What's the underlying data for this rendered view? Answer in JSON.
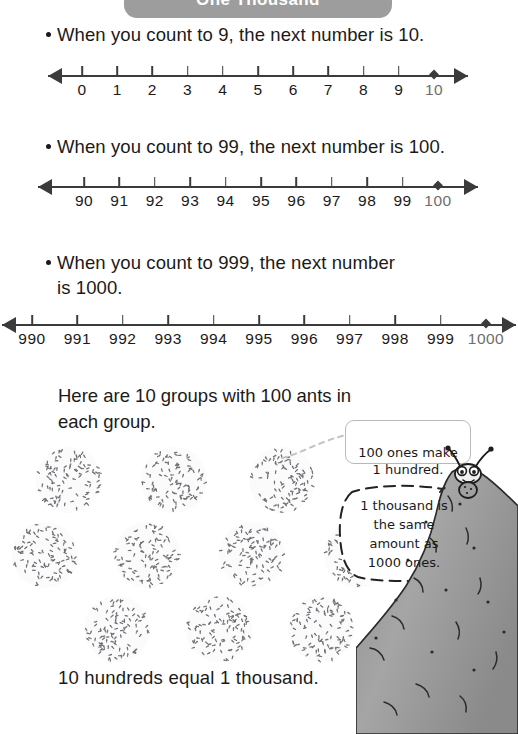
{
  "header": {
    "title": "One Thousand",
    "background_color": "#9d9d9d",
    "text_color": "#ffffff"
  },
  "bullets": [
    {
      "text": "When you count to 9, the next number is 10."
    },
    {
      "text": "When you count to 99, the next number is 100."
    },
    {
      "text": "When you count to 999, the next number\nis 1000."
    }
  ],
  "number_lines": [
    {
      "name": "ones-number-line",
      "labels": [
        "0",
        "1",
        "2",
        "3",
        "4",
        "5",
        "6",
        "7",
        "8",
        "9",
        "10"
      ],
      "marked_value": "10",
      "left_arrow": true,
      "right_arrow": true
    },
    {
      "name": "tens-number-line",
      "labels": [
        "90",
        "91",
        "92",
        "93",
        "94",
        "95",
        "96",
        "97",
        "98",
        "99",
        "100"
      ],
      "marked_value": "100",
      "left_arrow": true,
      "right_arrow": true
    },
    {
      "name": "hundreds-number-line",
      "labels": [
        "990",
        "991",
        "992",
        "993",
        "994",
        "995",
        "996",
        "997",
        "998",
        "999",
        "1000"
      ],
      "marked_value": "1000",
      "left_arrow": true,
      "right_arrow": true
    }
  ],
  "ants_section": {
    "intro": "Here are 10 groups with 100 ants in\neach group.",
    "conclusion": "10 hundreds equal 1 thousand.",
    "group_count": 10,
    "ants_per_group": 100,
    "rows": [
      3,
      4,
      3
    ]
  },
  "callouts": [
    {
      "name": "hundred-callout",
      "text": "100 ones make\n1 hundred.",
      "style": "rounded-box"
    },
    {
      "name": "thousand-callout",
      "text": "1 thousand is\nthe same\namount as\n1000 ones.",
      "style": "speech-bubble"
    }
  ],
  "illustration": {
    "character": "ant-on-hilltop",
    "hill_color": "#9a9a9a"
  },
  "chart_data": {
    "type": "table",
    "title": "One Thousand",
    "series": [
      {
        "name": "ones-line",
        "x": [
          0,
          1,
          2,
          3,
          4,
          5,
          6,
          7,
          8,
          9,
          10
        ],
        "highlight": 10
      },
      {
        "name": "tens-line",
        "x": [
          90,
          91,
          92,
          93,
          94,
          95,
          96,
          97,
          98,
          99,
          100
        ],
        "highlight": 100
      },
      {
        "name": "hundreds-line",
        "x": [
          990,
          991,
          992,
          993,
          994,
          995,
          996,
          997,
          998,
          999,
          1000
        ],
        "highlight": 1000
      }
    ],
    "groups": {
      "count": 10,
      "per_group": 100,
      "total": 1000
    }
  }
}
